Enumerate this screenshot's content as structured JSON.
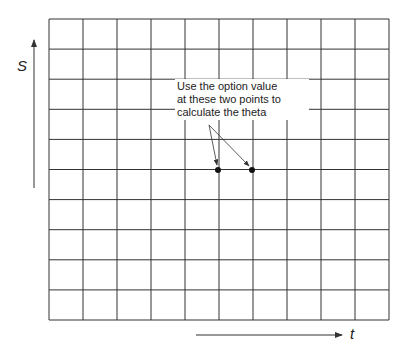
{
  "diagram": {
    "grid": {
      "columns": 10,
      "rows": 10,
      "left": 49,
      "top": 19,
      "cell_width": 34,
      "cell_height": 30.1,
      "line_color": "#333333"
    },
    "axes": {
      "vertical": {
        "label": "S",
        "direction": "up"
      },
      "horizontal": {
        "label": "t",
        "direction": "right"
      }
    },
    "annotation": {
      "text_line1": "Use the option value",
      "text_line2": "at these two points to",
      "text_line3": "calculate the theta"
    },
    "points": [
      {
        "x": 218,
        "y": 170
      },
      {
        "x": 252,
        "y": 170
      }
    ]
  }
}
